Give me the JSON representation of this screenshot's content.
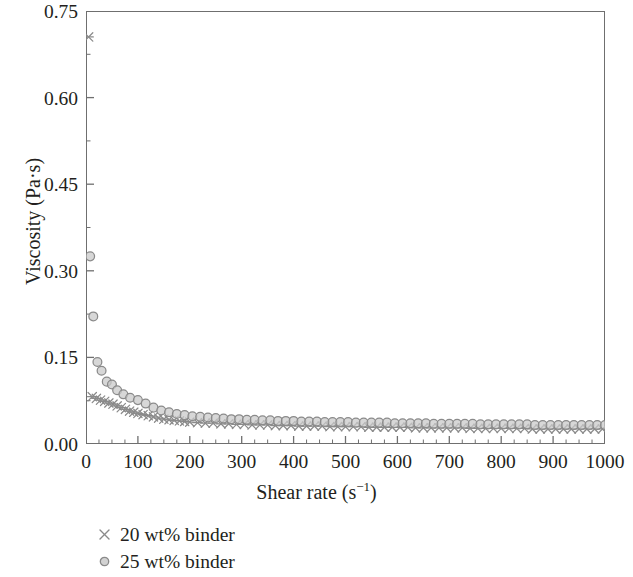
{
  "chart_data": {
    "type": "scatter",
    "title": "",
    "xlabel": "Shear rate (s−1)",
    "xlabel_base": "Shear rate (s",
    "xlabel_sup": "−1",
    "xlabel_tail": ")",
    "ylabel": "Viscosity (Pa·s)",
    "xlim": [
      0,
      1000
    ],
    "ylim": [
      0.0,
      0.75
    ],
    "xticks": [
      0,
      100,
      200,
      300,
      400,
      500,
      600,
      700,
      800,
      900,
      1000
    ],
    "xtick_labels": [
      "0",
      "100",
      "200",
      "300",
      "400",
      "500",
      "600",
      "700",
      "800",
      "900",
      "1000"
    ],
    "x_minor_step": 25,
    "yticks": [
      0.0,
      0.15,
      0.3,
      0.45,
      0.6,
      0.75
    ],
    "ytick_labels": [
      "0.00",
      "0.15",
      "0.30",
      "0.45",
      "0.60",
      "0.75"
    ],
    "y_minor_step": 0.075,
    "grid": false,
    "legend_position": "below-left",
    "axis_color": "#6f6f6f",
    "marker_color": "#8a8a8a",
    "marker_fill": "#c9c9c9",
    "series": [
      {
        "name": "20 wt% binder",
        "marker": "x",
        "color": "#8a8a8a",
        "points": [
          [
            5,
            0.705
          ],
          [
            12,
            0.082
          ],
          [
            20,
            0.079
          ],
          [
            28,
            0.076
          ],
          [
            36,
            0.074
          ],
          [
            44,
            0.071
          ],
          [
            52,
            0.069
          ],
          [
            60,
            0.066
          ],
          [
            68,
            0.063
          ],
          [
            76,
            0.06
          ],
          [
            84,
            0.057
          ],
          [
            92,
            0.055
          ],
          [
            100,
            0.053
          ],
          [
            110,
            0.051
          ],
          [
            120,
            0.049
          ],
          [
            130,
            0.047
          ],
          [
            140,
            0.045
          ],
          [
            150,
            0.043
          ],
          [
            160,
            0.042
          ],
          [
            170,
            0.041
          ],
          [
            180,
            0.04
          ],
          [
            190,
            0.039
          ],
          [
            200,
            0.038
          ],
          [
            215,
            0.037
          ],
          [
            230,
            0.036
          ],
          [
            245,
            0.036
          ],
          [
            260,
            0.035
          ],
          [
            275,
            0.035
          ],
          [
            290,
            0.034
          ],
          [
            305,
            0.034
          ],
          [
            320,
            0.033
          ],
          [
            335,
            0.033
          ],
          [
            350,
            0.033
          ],
          [
            365,
            0.032
          ],
          [
            380,
            0.032
          ],
          [
            395,
            0.032
          ],
          [
            410,
            0.031
          ],
          [
            425,
            0.031
          ],
          [
            440,
            0.031
          ],
          [
            455,
            0.031
          ],
          [
            470,
            0.03
          ],
          [
            485,
            0.03
          ],
          [
            500,
            0.03
          ],
          [
            515,
            0.03
          ],
          [
            530,
            0.03
          ],
          [
            545,
            0.029
          ],
          [
            560,
            0.029
          ],
          [
            575,
            0.029
          ],
          [
            590,
            0.029
          ],
          [
            605,
            0.029
          ],
          [
            620,
            0.029
          ],
          [
            635,
            0.028
          ],
          [
            650,
            0.028
          ],
          [
            665,
            0.028
          ],
          [
            680,
            0.028
          ],
          [
            695,
            0.028
          ],
          [
            710,
            0.028
          ],
          [
            725,
            0.028
          ],
          [
            740,
            0.027
          ],
          [
            755,
            0.027
          ],
          [
            770,
            0.027
          ],
          [
            785,
            0.027
          ],
          [
            800,
            0.027
          ],
          [
            815,
            0.027
          ],
          [
            830,
            0.027
          ],
          [
            845,
            0.027
          ],
          [
            860,
            0.026
          ],
          [
            875,
            0.026
          ],
          [
            890,
            0.026
          ],
          [
            905,
            0.026
          ],
          [
            920,
            0.026
          ],
          [
            935,
            0.026
          ],
          [
            950,
            0.026
          ],
          [
            965,
            0.026
          ],
          [
            980,
            0.026
          ],
          [
            995,
            0.026
          ]
        ]
      },
      {
        "name": "25 wt% binder",
        "marker": "circle",
        "color": "#8a8a8a",
        "points": [
          [
            8,
            0.325
          ],
          [
            14,
            0.221
          ],
          [
            22,
            0.142
          ],
          [
            30,
            0.127
          ],
          [
            40,
            0.108
          ],
          [
            50,
            0.103
          ],
          [
            60,
            0.093
          ],
          [
            72,
            0.086
          ],
          [
            85,
            0.08
          ],
          [
            100,
            0.076
          ],
          [
            115,
            0.07
          ],
          [
            130,
            0.063
          ],
          [
            145,
            0.058
          ],
          [
            160,
            0.055
          ],
          [
            175,
            0.052
          ],
          [
            190,
            0.05
          ],
          [
            205,
            0.048
          ],
          [
            220,
            0.047
          ],
          [
            235,
            0.046
          ],
          [
            250,
            0.045
          ],
          [
            265,
            0.044
          ],
          [
            280,
            0.043
          ],
          [
            295,
            0.043
          ],
          [
            310,
            0.042
          ],
          [
            325,
            0.042
          ],
          [
            340,
            0.041
          ],
          [
            355,
            0.041
          ],
          [
            370,
            0.04
          ],
          [
            385,
            0.04
          ],
          [
            400,
            0.04
          ],
          [
            415,
            0.039
          ],
          [
            430,
            0.039
          ],
          [
            445,
            0.039
          ],
          [
            460,
            0.038
          ],
          [
            475,
            0.038
          ],
          [
            490,
            0.038
          ],
          [
            505,
            0.038
          ],
          [
            520,
            0.037
          ],
          [
            535,
            0.037
          ],
          [
            550,
            0.037
          ],
          [
            565,
            0.037
          ],
          [
            580,
            0.037
          ],
          [
            595,
            0.036
          ],
          [
            610,
            0.036
          ],
          [
            625,
            0.036
          ],
          [
            640,
            0.036
          ],
          [
            655,
            0.036
          ],
          [
            670,
            0.035
          ],
          [
            685,
            0.035
          ],
          [
            700,
            0.035
          ],
          [
            715,
            0.035
          ],
          [
            730,
            0.035
          ],
          [
            745,
            0.035
          ],
          [
            760,
            0.034
          ],
          [
            775,
            0.034
          ],
          [
            790,
            0.034
          ],
          [
            805,
            0.034
          ],
          [
            820,
            0.034
          ],
          [
            835,
            0.034
          ],
          [
            850,
            0.034
          ],
          [
            865,
            0.033
          ],
          [
            880,
            0.033
          ],
          [
            895,
            0.033
          ],
          [
            910,
            0.033
          ],
          [
            925,
            0.033
          ],
          [
            940,
            0.033
          ],
          [
            955,
            0.033
          ],
          [
            970,
            0.033
          ],
          [
            985,
            0.033
          ],
          [
            1000,
            0.033
          ]
        ]
      }
    ]
  },
  "legend": {
    "items": [
      {
        "label": "20 wt% binder",
        "marker": "x"
      },
      {
        "label": "25 wt% binder",
        "marker": "circle"
      }
    ]
  }
}
